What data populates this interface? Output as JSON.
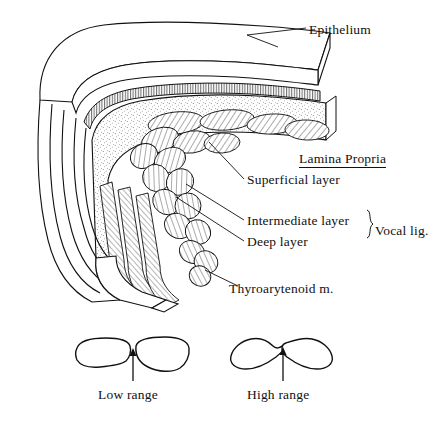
{
  "figure": {
    "ink_color": "#111111",
    "background_color": "#ffffff",
    "labels": {
      "epithelium": "Epithelium",
      "lamina_propria": "Lamina Propria",
      "superficial_layer": "Superficial layer",
      "intermediate_layer": "Intermediate layer",
      "deep_layer": "Deep layer",
      "vocal_ligament": "Vocal lig.",
      "thyroarytenoid": "Thyroarytenoid m."
    },
    "insets": {
      "low": {
        "caption": "Low range"
      },
      "high": {
        "caption": "High range"
      }
    }
  }
}
